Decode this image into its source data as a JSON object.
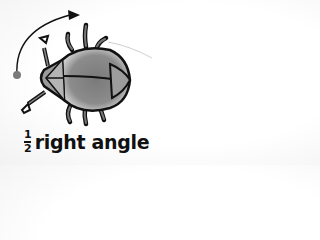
{
  "illustration": {
    "subject": "bug-robot",
    "rotation_arrow": "clockwise-arc-arrow",
    "colors": {
      "outline": "#111111",
      "body": "#8a8a8a",
      "body_highlight": "#d8d8d8",
      "head": "#9a9a9a",
      "start_dot": "#7a7a7a",
      "background": "#ffffff"
    }
  },
  "label": {
    "numerator": "1",
    "denominator": "2",
    "text": "right angle"
  }
}
